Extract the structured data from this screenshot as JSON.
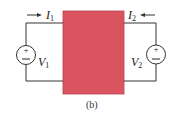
{
  "diagram": {
    "type": "two-port network",
    "caption": "(b)",
    "box_color": "#d9545f",
    "left_port": {
      "current_label": "I",
      "current_sub": "1",
      "current_direction": "into box (right arrow)",
      "voltage_label": "V",
      "voltage_sub": "1",
      "source_plus": "+",
      "source_minus": "−"
    },
    "right_port": {
      "current_label": "I",
      "current_sub": "2",
      "current_direction": "into box (left arrow)",
      "voltage_label": "V",
      "voltage_sub": "2",
      "source_plus": "+",
      "source_minus": "−"
    }
  }
}
